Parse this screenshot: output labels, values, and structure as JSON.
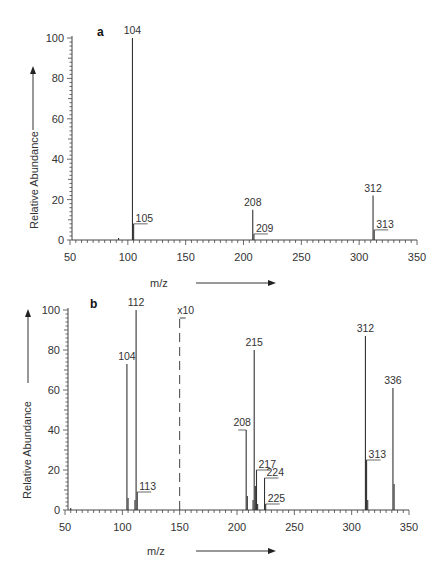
{
  "chart_data": [
    {
      "type": "bar",
      "panel": "a",
      "title": "",
      "xlabel": "m/z",
      "ylabel": "Relative Abundance",
      "xlim": [
        50,
        350
      ],
      "ylim": [
        0,
        100
      ],
      "xticks": [
        50,
        100,
        150,
        200,
        250,
        300,
        350
      ],
      "yticks": [
        0,
        20,
        40,
        60,
        80,
        100
      ],
      "grid": false,
      "peaks": [
        {
          "mz": 92,
          "abundance": 1,
          "label": ""
        },
        {
          "mz": 104,
          "abundance": 100,
          "label": "104"
        },
        {
          "mz": 105,
          "abundance": 8,
          "label": "105"
        },
        {
          "mz": 208,
          "abundance": 15,
          "label": "208"
        },
        {
          "mz": 209,
          "abundance": 3,
          "label": "209"
        },
        {
          "mz": 312,
          "abundance": 22,
          "label": "312"
        },
        {
          "mz": 313,
          "abundance": 5,
          "label": "313"
        }
      ]
    },
    {
      "type": "bar",
      "panel": "b",
      "title": "",
      "xlabel": "m/z",
      "ylabel": "Relative Abundance",
      "xlim": [
        50,
        350
      ],
      "ylim": [
        0,
        100
      ],
      "xticks": [
        50,
        100,
        150,
        200,
        250,
        300,
        350
      ],
      "yticks": [
        0,
        20,
        40,
        60,
        80,
        100
      ],
      "grid": false,
      "annotation": {
        "text": "x10",
        "mz": 150,
        "note": "dashed line marks x10 magnification for m/z > 150"
      },
      "peaks": [
        {
          "mz": 55,
          "abundance": 1,
          "label": ""
        },
        {
          "mz": 104,
          "abundance": 73,
          "label": "104"
        },
        {
          "mz": 105,
          "abundance": 6,
          "label": ""
        },
        {
          "mz": 111,
          "abundance": 5,
          "label": ""
        },
        {
          "mz": 112,
          "abundance": 100,
          "label": "112"
        },
        {
          "mz": 113,
          "abundance": 9,
          "label": "113"
        },
        {
          "mz": 208,
          "abundance": 40,
          "label": "208"
        },
        {
          "mz": 209,
          "abundance": 7,
          "label": ""
        },
        {
          "mz": 214,
          "abundance": 5,
          "label": ""
        },
        {
          "mz": 215,
          "abundance": 80,
          "label": "215"
        },
        {
          "mz": 216,
          "abundance": 12,
          "label": ""
        },
        {
          "mz": 217,
          "abundance": 20,
          "label": "217"
        },
        {
          "mz": 218,
          "abundance": 3,
          "label": ""
        },
        {
          "mz": 224,
          "abundance": 16,
          "label": "224"
        },
        {
          "mz": 225,
          "abundance": 3,
          "label": "225"
        },
        {
          "mz": 312,
          "abundance": 87,
          "label": "312"
        },
        {
          "mz": 313,
          "abundance": 25,
          "label": "313"
        },
        {
          "mz": 314,
          "abundance": 5,
          "label": ""
        },
        {
          "mz": 336,
          "abundance": 61,
          "label": "336"
        },
        {
          "mz": 337,
          "abundance": 13,
          "label": ""
        }
      ]
    }
  ],
  "panels": {
    "a": {
      "label": "a",
      "ylabel": "Relative Abundance",
      "xlabel": "m/z"
    },
    "b": {
      "label": "b",
      "ylabel": "Relative Abundance",
      "xlabel": "m/z",
      "annotation": "x10"
    }
  }
}
